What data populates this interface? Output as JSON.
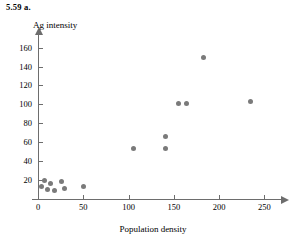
{
  "exercise": {
    "label": "5.59  a."
  },
  "chart_data": {
    "type": "scatter",
    "title": "",
    "xlabel": "Population density",
    "ylabel": "Ag intensity",
    "xlim": [
      0,
      265
    ],
    "ylim": [
      0,
      168
    ],
    "grid": false,
    "legend": null,
    "marker": {
      "shape": "circle",
      "color": "#7a7a7a",
      "size": 5
    },
    "xticks": [
      0,
      50,
      100,
      150,
      200,
      250
    ],
    "yticks": [
      20,
      40,
      60,
      80,
      100,
      120,
      140,
      160
    ],
    "xtick_labels": [
      "0",
      "50",
      "100",
      "150",
      "200",
      "250"
    ],
    "ytick_labels": [
      "20",
      "40",
      "60",
      "80",
      "100",
      "120",
      "140",
      "160"
    ],
    "points": [
      {
        "x": 4,
        "y": 13
      },
      {
        "x": 7,
        "y": 20
      },
      {
        "x": 10,
        "y": 10
      },
      {
        "x": 14,
        "y": 16
      },
      {
        "x": 18,
        "y": 9
      },
      {
        "x": 26,
        "y": 19
      },
      {
        "x": 29,
        "y": 11
      },
      {
        "x": 50,
        "y": 13
      },
      {
        "x": 105,
        "y": 53
      },
      {
        "x": 141,
        "y": 53
      },
      {
        "x": 141,
        "y": 66
      },
      {
        "x": 155,
        "y": 101
      },
      {
        "x": 164,
        "y": 101
      },
      {
        "x": 183,
        "y": 150
      },
      {
        "x": 235,
        "y": 103
      }
    ]
  }
}
